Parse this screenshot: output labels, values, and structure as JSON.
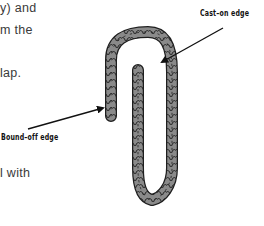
{
  "body_text": {
    "lines": [
      "y) and",
      "m the",
      "lap.",
      "l with"
    ]
  },
  "figure": {
    "labels": {
      "cast_on": "Cast–on edge",
      "bound_off": "Bound–off edge"
    },
    "colors": {
      "strand_fill": "#8a8a8a",
      "strand_outline": "#1e1e1e",
      "arrow": "#111111"
    }
  }
}
